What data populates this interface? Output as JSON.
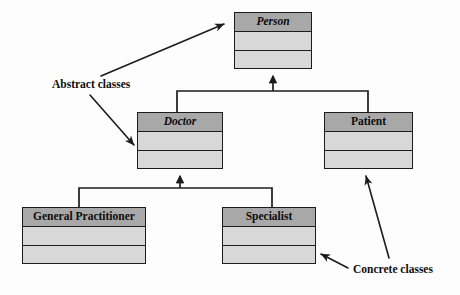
{
  "diagram": {
    "colors": {
      "header_fill": "#a8a8a8",
      "body_fill": "#d8d8d8",
      "stroke": "#1c1c1c",
      "background": "#fdfdfd",
      "text": "#0d0d0d"
    },
    "classes": [
      {
        "id": "person",
        "name": "Person",
        "abstract": true,
        "x": 234,
        "y": 12,
        "w": 78,
        "h": 57
      },
      {
        "id": "doctor",
        "name": "Doctor",
        "abstract": true,
        "x": 137,
        "y": 112,
        "w": 86,
        "h": 57
      },
      {
        "id": "patient",
        "name": "Patient",
        "abstract": false,
        "x": 324,
        "y": 112,
        "w": 89,
        "h": 57
      },
      {
        "id": "general-practitioner",
        "name": "General Practitioner",
        "abstract": false,
        "x": 22,
        "y": 207,
        "w": 124,
        "h": 57
      },
      {
        "id": "specialist",
        "name": "Specialist",
        "abstract": false,
        "x": 222,
        "y": 207,
        "w": 94,
        "h": 57
      }
    ],
    "generalizations": [
      {
        "id": "doctor-to-person",
        "from": "doctor",
        "to": "person"
      },
      {
        "id": "patient-to-person",
        "from": "patient",
        "to": "person"
      },
      {
        "id": "gp-to-doctor",
        "from": "general-practitioner",
        "to": "doctor"
      },
      {
        "id": "specialist-to-doctor",
        "from": "specialist",
        "to": "doctor"
      }
    ],
    "annotations": [
      {
        "id": "abstract-classes",
        "label": "Abstract classes",
        "x": 52,
        "y": 78,
        "targets": [
          "person",
          "doctor"
        ]
      },
      {
        "id": "concrete-classes",
        "label": "Concrete classes",
        "x": 353,
        "y": 263,
        "targets": [
          "specialist",
          "patient"
        ]
      }
    ]
  }
}
